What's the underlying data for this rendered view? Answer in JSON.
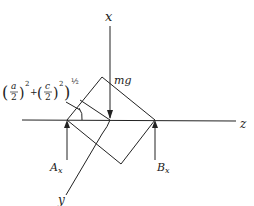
{
  "diagram": {
    "type": "free-body diagram",
    "axes": {
      "vertical": "x",
      "horizontal": "z",
      "oblique": "y"
    },
    "forces": {
      "weight": "mg",
      "support_a": "A",
      "support_a_sub": "x",
      "support_b": "B",
      "support_b_sub": "x"
    },
    "dimension_label": {
      "a_num": "a",
      "a_den": "2",
      "c_num": "c",
      "c_den": "2",
      "exp_sq1": "2",
      "exp_sq2": "2",
      "exp_half": "½",
      "plus": "+"
    },
    "colors": {
      "ink": "#222222",
      "background": "#ffffff"
    }
  }
}
